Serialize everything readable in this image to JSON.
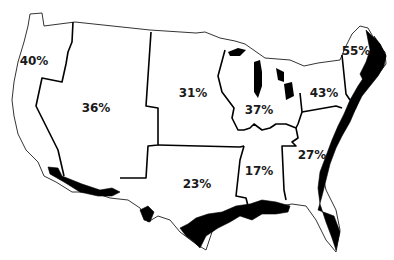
{
  "map": {
    "type": "choropleth-outline",
    "subject": "United States regions",
    "regions": [
      {
        "id": "pacific",
        "label": "40%",
        "x": 34,
        "y": 61
      },
      {
        "id": "mountain",
        "label": "36%",
        "x": 96,
        "y": 108
      },
      {
        "id": "west-north-central",
        "label": "31%",
        "x": 193,
        "y": 93
      },
      {
        "id": "east-north-central",
        "label": "37%",
        "x": 259,
        "y": 110
      },
      {
        "id": "middle-atlantic",
        "label": "43%",
        "x": 324,
        "y": 93
      },
      {
        "id": "new-england",
        "label": "55%",
        "x": 356,
        "y": 51
      },
      {
        "id": "west-south-central",
        "label": "23%",
        "x": 197,
        "y": 184
      },
      {
        "id": "east-south-central",
        "label": "17%",
        "x": 259,
        "y": 171
      },
      {
        "id": "south-atlantic",
        "label": "27%",
        "x": 312,
        "y": 155
      }
    ]
  }
}
